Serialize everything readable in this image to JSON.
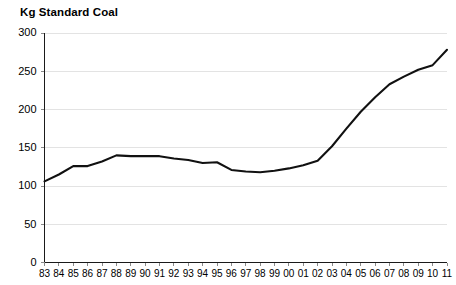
{
  "chart_data": {
    "type": "line",
    "title": "Kg Standard Coal",
    "xlabel": "",
    "ylabel": "Kg Standard Coal",
    "ylim": [
      0,
      300
    ],
    "yticks": [
      0,
      50,
      100,
      150,
      200,
      250,
      300
    ],
    "grid": true,
    "legend": "none",
    "categories": [
      "83",
      "84",
      "85",
      "86",
      "87",
      "88",
      "89",
      "90",
      "91",
      "92",
      "93",
      "94",
      "95",
      "96",
      "97",
      "98",
      "99",
      "00",
      "01",
      "02",
      "03",
      "04",
      "05",
      "06",
      "07",
      "08",
      "09",
      "10",
      "11"
    ],
    "values": [
      106,
      115,
      126,
      126,
      132,
      140,
      139,
      139,
      139,
      136,
      134,
      130,
      131,
      121,
      119,
      118,
      120,
      123,
      127,
      133,
      152,
      175,
      197,
      216,
      233,
      243,
      252,
      258,
      278
    ],
    "series": [
      {
        "name": "Kg Standard Coal",
        "values": [
          106,
          115,
          126,
          126,
          132,
          140,
          139,
          139,
          139,
          136,
          134,
          130,
          131,
          121,
          119,
          118,
          120,
          123,
          127,
          133,
          152,
          175,
          197,
          216,
          233,
          243,
          252,
          258,
          278
        ]
      }
    ]
  },
  "colors": {
    "line": "#111111",
    "grid": "#e3e3e3",
    "axis": "#1a1a1a",
    "background": "#ffffff"
  }
}
